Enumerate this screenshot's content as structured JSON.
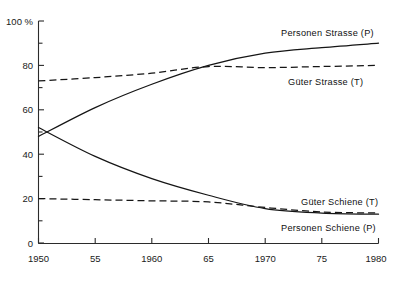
{
  "chart_data": {
    "type": "line",
    "title": "",
    "xlabel": "",
    "ylabel": "",
    "y_unit": "100 %",
    "xlim": [
      1950,
      1980
    ],
    "ylim": [
      0,
      100
    ],
    "grid": false,
    "legend_position": "inline-right",
    "x_ticks": [
      1950,
      1955,
      1960,
      1965,
      1970,
      1975,
      1980
    ],
    "x_tick_labels": [
      "1950",
      "55",
      "1960",
      "65",
      "1970",
      "75",
      "1980"
    ],
    "y_ticks": [
      0,
      10,
      20,
      30,
      40,
      50,
      60,
      70,
      80,
      90,
      100
    ],
    "y_tick_labels": [
      "0",
      "",
      "20",
      "",
      "40",
      "",
      "60",
      "",
      "80",
      "",
      "100 %"
    ],
    "x": [
      1950,
      1955,
      1960,
      1965,
      1970,
      1975,
      1980
    ],
    "series": [
      {
        "name": "Personen Strasse (P)",
        "label": "Personen Strasse (P)",
        "style": "solid",
        "color": "#151515",
        "values": [
          48,
          61,
          71.5,
          80,
          85.5,
          88,
          90
        ]
      },
      {
        "name": "Güter Strasse (T)",
        "label": "Güter Strasse (T)",
        "style": "dashed",
        "color": "#151515",
        "values": [
          73,
          74.5,
          76.5,
          79.5,
          79,
          79.5,
          80
        ]
      },
      {
        "name": "Personen Schiene (P)",
        "label": "Personen Schiene (P)",
        "style": "solid",
        "color": "#151515",
        "values": [
          52,
          39,
          29,
          21.5,
          15.5,
          13.5,
          13
        ]
      },
      {
        "name": "Güter Schiene (T)",
        "label": "Güter Schiene (T)",
        "style": "dashed",
        "color": "#151515",
        "values": [
          20,
          19.5,
          19,
          18.5,
          16,
          14,
          13.5
        ]
      }
    ]
  },
  "axis": {
    "y_top_label": "100 %",
    "y_labels": [
      "80",
      "60",
      "40",
      "20",
      "0"
    ],
    "x_labels": [
      "1950",
      "55",
      "1960",
      "65",
      "1970",
      "75",
      "1980"
    ]
  },
  "labels": {
    "personen_strasse": "Personen Strasse (P)",
    "gueter_strasse": "Güter Strasse (T)",
    "gueter_schiene": "Güter Schiene (T)",
    "personen_schiene": "Personen Schiene (P)"
  },
  "colors": {
    "ink": "#151515",
    "axis": "#2b2b2b",
    "background": "#ffffff"
  }
}
